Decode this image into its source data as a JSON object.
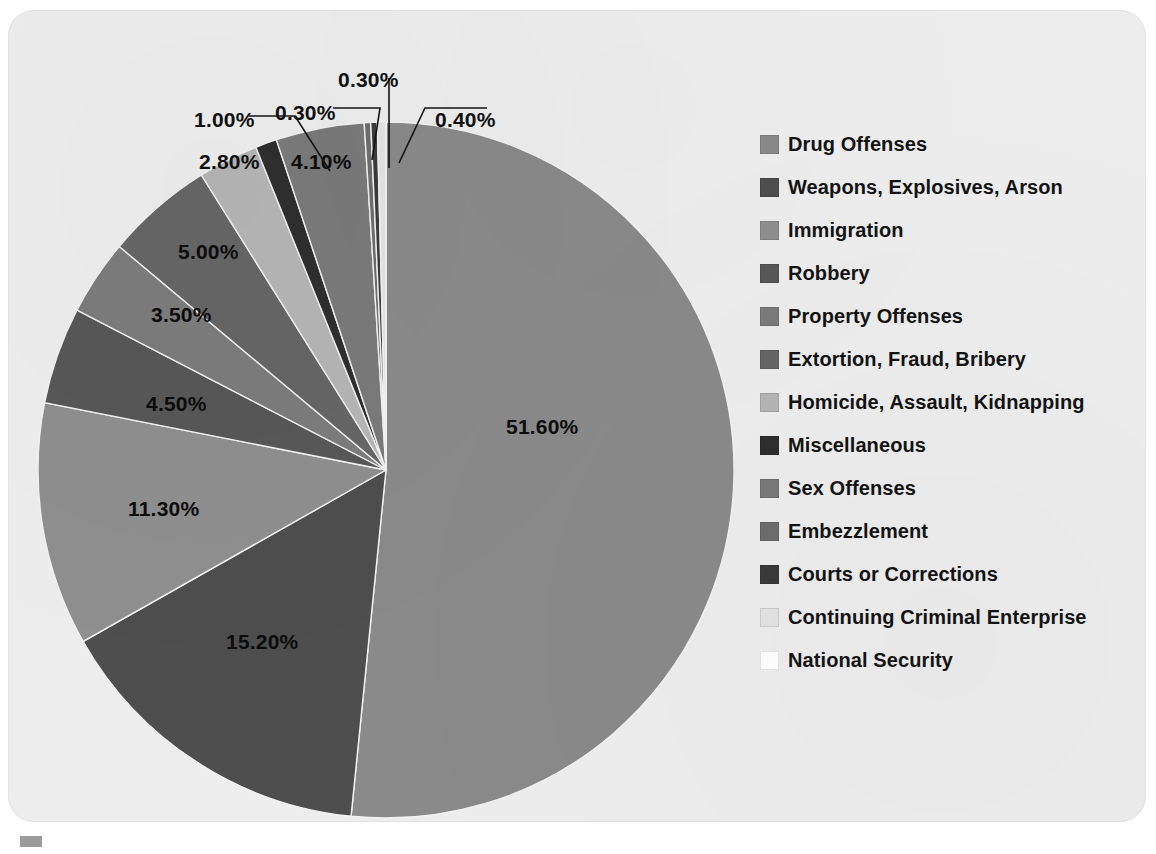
{
  "chart_data": {
    "type": "pie",
    "title": "",
    "subtitle": "",
    "xlabel": "",
    "ylabel": "",
    "legend_position": "right",
    "grid": false,
    "start_angle_deg": 0,
    "direction": "clockwise",
    "units": "percent",
    "categories": [
      "Drug Offenses",
      "Weapons, Explosives, Arson",
      "Immigration",
      "Robbery",
      "Property Offenses",
      "Extortion, Fraud, Bribery",
      "Homicide, Assault, Kidnapping",
      "Miscellaneous",
      "Sex Offenses",
      "Embezzlement",
      "Courts or Corrections",
      "Continuing Criminal Enterprise",
      "National Security"
    ],
    "values": [
      51.6,
      15.2,
      11.3,
      4.5,
      3.5,
      5.0,
      2.8,
      1.0,
      4.1,
      0.3,
      0.3,
      0.4,
      0.0
    ],
    "value_labels": [
      "51.60%",
      "15.20%",
      "11.30%",
      "4.50%",
      "3.50%",
      "5.00%",
      "2.80%",
      "1.00%",
      "4.10%",
      "0.30%",
      "0.30%",
      "0.40%",
      ""
    ],
    "colors": [
      "#8a8a8a",
      "#4e4e4e",
      "#8f8f8f",
      "#585858",
      "#7c7c7c",
      "#666666",
      "#b5b5b5",
      "#2f2f2f",
      "#7a7a7a",
      "#6e6e6e",
      "#3b3b3b",
      "#e3e3e3",
      "#ffffff"
    ]
  },
  "figure": {
    "background_color": "#ededed",
    "page_color": "#ffffff",
    "label_color": "#111111"
  },
  "legend": {
    "items": [
      {
        "label": "Drug Offenses",
        "color": "#8a8a8a"
      },
      {
        "label": "Weapons, Explosives, Arson",
        "color": "#4e4e4e"
      },
      {
        "label": "Immigration",
        "color": "#8f8f8f"
      },
      {
        "label": "Robbery",
        "color": "#585858"
      },
      {
        "label": "Property Offenses",
        "color": "#7c7c7c"
      },
      {
        "label": "Extortion, Fraud, Bribery",
        "color": "#666666"
      },
      {
        "label": "Homicide, Assault, Kidnapping",
        "color": "#b5b5b5"
      },
      {
        "label": "Miscellaneous",
        "color": "#2f2f2f"
      },
      {
        "label": "Sex Offenses",
        "color": "#7a7a7a"
      },
      {
        "label": "Embezzlement",
        "color": "#6e6e6e"
      },
      {
        "label": "Courts or Corrections",
        "color": "#3b3b3b"
      },
      {
        "label": "Continuing Criminal Enterprise",
        "color": "#e3e3e3"
      },
      {
        "label": "National Security",
        "color": "#ffffff"
      }
    ]
  },
  "slice_labels": [
    {
      "text": "51.60%",
      "x": 498,
      "y": 405,
      "on_dark": true
    },
    {
      "text": "15.20%",
      "x": 218,
      "y": 620,
      "on_dark": true
    },
    {
      "text": "11.30%",
      "x": 120,
      "y": 487,
      "on_dark": true
    },
    {
      "text": "4.50%",
      "x": 138,
      "y": 382,
      "on_dark": true
    },
    {
      "text": "3.50%",
      "x": 143,
      "y": 293,
      "on_dark": true
    },
    {
      "text": "5.00%",
      "x": 170,
      "y": 230,
      "on_dark": true
    },
    {
      "text": "2.80%",
      "x": 191,
      "y": 140,
      "on_dark": false
    },
    {
      "text": "1.00%",
      "x": 186,
      "y": 98,
      "on_dark": false
    },
    {
      "text": "4.10%",
      "x": 283,
      "y": 140,
      "on_dark": true
    },
    {
      "text": "0.30%",
      "x": 267,
      "y": 91,
      "on_dark": false
    },
    {
      "text": "0.30%",
      "x": 330,
      "y": 58,
      "on_dark": false
    },
    {
      "text": "0.40%",
      "x": 427,
      "y": 98,
      "on_dark": false
    }
  ]
}
